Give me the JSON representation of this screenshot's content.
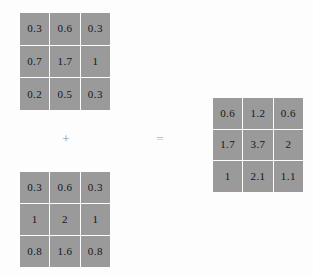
{
  "background_color": "#fdfdfd",
  "cell_color": "#9a9a9a",
  "text_color": "#15151a",
  "separator_color": "#fdfdfd",
  "equation": {
    "operator_plus": "+",
    "operator_equals": "="
  },
  "chart_data": {
    "type": "table",
    "title": "",
    "matrices": [
      {
        "name": "matrix-a",
        "role": "first-operand",
        "rows": [
          [
            "0.3",
            "0.6",
            "0.3"
          ],
          [
            "0.7",
            "1.7",
            "1"
          ],
          [
            "0.2",
            "0.5",
            "0.3"
          ]
        ]
      },
      {
        "name": "matrix-b",
        "role": "second-operand",
        "rows": [
          [
            "0.3",
            "0.6",
            "0.3"
          ],
          [
            "1",
            "2",
            "1"
          ],
          [
            "0.8",
            "1.6",
            "0.8"
          ]
        ]
      },
      {
        "name": "matrix-result",
        "role": "result",
        "rows": [
          [
            "0.6",
            "1.2",
            "0.6"
          ],
          [
            "1.7",
            "3.7",
            "2"
          ],
          [
            "1",
            "2.1",
            "1.1"
          ]
        ]
      }
    ]
  }
}
